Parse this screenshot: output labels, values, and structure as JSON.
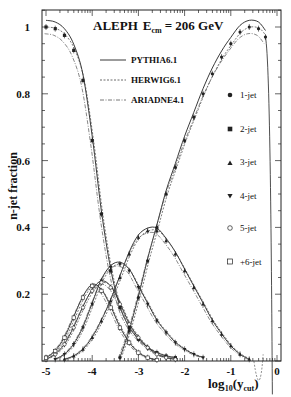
{
  "chart_data": {
    "type": "line",
    "title_main": "ALEPH",
    "title_energy_label": "E",
    "title_energy_sub": "cm",
    "title_energy_value": "= 206 GeV",
    "xlabel": "log10(ycut)",
    "xlabel_main": "log",
    "xlabel_sub1": "10",
    "xlabel_paren": "(y",
    "xlabel_sub2": "cut",
    "xlabel_close": ")",
    "ylabel": "n-jet fraction",
    "xlim": [
      -5.0,
      0.1
    ],
    "ylim": [
      0,
      1.05
    ],
    "xticks": [
      "-5",
      "-4",
      "-3",
      "-2",
      "-1",
      "0"
    ],
    "yticks": [
      "0.2",
      "0.4",
      "0.6",
      "0.8",
      "1"
    ],
    "grid": false,
    "legend_models": [
      "PYTHIA6.1",
      "HERWIG6.1",
      "ARIADNE4.1"
    ],
    "legend_jets": [
      "1-jet",
      "2-jet",
      "3-jet",
      "4-jet",
      "5-jet",
      "+6-jet"
    ],
    "legend_position": "upper-right (inside)",
    "series": [
      {
        "name": "1-jet",
        "marker": "filled-circle",
        "x": [
          -3.4,
          -3.2,
          -3.0,
          -2.8,
          -2.6,
          -2.4,
          -2.2,
          -2.0,
          -1.8,
          -1.6,
          -1.4,
          -1.2,
          -1.0,
          -0.8,
          -0.6,
          -0.4,
          -0.25
        ],
        "values": [
          0.01,
          0.09,
          0.19,
          0.3,
          0.4,
          0.5,
          0.58,
          0.66,
          0.73,
          0.8,
          0.86,
          0.91,
          0.95,
          0.985,
          1.0,
          0.995,
          0.97
        ]
      },
      {
        "name": "2-jet",
        "marker": "filled-square",
        "x": [
          -5.0,
          -4.8,
          -4.6,
          -4.4,
          -4.2,
          -4.0,
          -3.8,
          -3.6,
          -3.4,
          -3.2,
          -3.0,
          -2.8,
          -2.6,
          -2.4,
          -2.2
        ],
        "values": [
          1.0,
          0.995,
          0.975,
          0.93,
          0.84,
          0.66,
          0.44,
          0.27,
          0.16,
          0.1,
          0.065,
          0.04,
          0.025,
          0.015,
          0.01
        ]
      },
      {
        "name": "3-jet",
        "marker": "filled-triangle-up",
        "x": [
          -4.6,
          -4.4,
          -4.2,
          -4.0,
          -3.8,
          -3.6,
          -3.4,
          -3.2,
          -3.0,
          -2.8,
          -2.6,
          -2.4,
          -2.2,
          -2.0,
          -1.8,
          -1.6,
          -1.4,
          -1.2,
          -1.0,
          -0.8,
          -0.6
        ],
        "values": [
          0.005,
          0.015,
          0.035,
          0.07,
          0.12,
          0.18,
          0.25,
          0.32,
          0.37,
          0.39,
          0.39,
          0.36,
          0.32,
          0.27,
          0.22,
          0.17,
          0.12,
          0.08,
          0.045,
          0.02,
          0.005
        ]
      },
      {
        "name": "4-jet",
        "marker": "filled-triangle-down",
        "x": [
          -4.8,
          -4.6,
          -4.4,
          -4.2,
          -4.0,
          -3.8,
          -3.6,
          -3.4,
          -3.2,
          -3.0,
          -2.8,
          -2.6,
          -2.4,
          -2.2,
          -2.0,
          -1.8,
          -1.6
        ],
        "values": [
          0.005,
          0.02,
          0.05,
          0.1,
          0.17,
          0.24,
          0.28,
          0.29,
          0.27,
          0.22,
          0.17,
          0.12,
          0.085,
          0.055,
          0.035,
          0.02,
          0.01
        ]
      },
      {
        "name": "5-jet",
        "marker": "open-circle",
        "x": [
          -5.0,
          -4.8,
          -4.6,
          -4.4,
          -4.2,
          -4.0,
          -3.8,
          -3.6,
          -3.4,
          -3.2,
          -3.0,
          -2.8,
          -2.6,
          -2.4,
          -2.2
        ],
        "values": [
          0.005,
          0.02,
          0.05,
          0.1,
          0.16,
          0.21,
          0.235,
          0.22,
          0.17,
          0.11,
          0.07,
          0.04,
          0.02,
          0.01,
          0.005
        ]
      },
      {
        "name": "+6-jet",
        "marker": "open-square",
        "x": [
          -5.0,
          -4.8,
          -4.6,
          -4.4,
          -4.2,
          -4.0,
          -3.8,
          -3.6,
          -3.4,
          -3.2,
          -3.0,
          -2.8,
          -2.6
        ],
        "values": [
          0.01,
          0.03,
          0.07,
          0.13,
          0.19,
          0.225,
          0.21,
          0.16,
          0.1,
          0.055,
          0.025,
          0.01,
          0.003
        ]
      }
    ]
  },
  "figure_annotations": {
    "frame_color": "#222222",
    "line_color": "#222222"
  }
}
